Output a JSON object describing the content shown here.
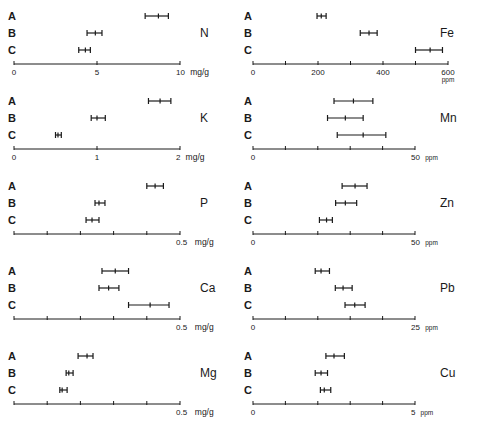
{
  "chart_data": [
    {
      "type": "errorbar",
      "element": "N",
      "unit": "mg/g",
      "xlim": [
        0,
        10
      ],
      "ticks": [
        0,
        5,
        10
      ],
      "tick_labels": [
        "0",
        "5",
        "10"
      ],
      "minor_ticks": [],
      "unit_label": "mg/g",
      "groups": [
        {
          "name": "A",
          "mean": 8.7,
          "low": 7.9,
          "high": 9.3
        },
        {
          "name": "B",
          "mean": 4.9,
          "low": 4.4,
          "high": 5.3
        },
        {
          "name": "C",
          "mean": 4.3,
          "low": 3.9,
          "high": 4.6
        }
      ]
    },
    {
      "type": "errorbar",
      "element": "K",
      "unit": "mg/g",
      "xlim": [
        0,
        2
      ],
      "ticks": [
        0,
        1,
        2
      ],
      "tick_labels": [
        "0",
        "1",
        "2"
      ],
      "unit_label": "mg/g",
      "groups": [
        {
          "name": "A",
          "mean": 1.76,
          "low": 1.62,
          "high": 1.89
        },
        {
          "name": "B",
          "mean": 1.0,
          "low": 0.93,
          "high": 1.1
        },
        {
          "name": "C",
          "mean": 0.53,
          "low": 0.5,
          "high": 0.57
        }
      ]
    },
    {
      "type": "errorbar",
      "element": "P",
      "unit": "mg/g",
      "xlim": [
        0,
        0.5
      ],
      "ticks": [
        0,
        0.1,
        0.2,
        0.3,
        0.4,
        0.5
      ],
      "tick_labels": [
        "",
        "",
        "",
        "",
        "",
        "0.5"
      ],
      "unit_label": "mg/g",
      "groups": [
        {
          "name": "A",
          "mean": 0.425,
          "low": 0.4,
          "high": 0.45
        },
        {
          "name": "B",
          "mean": 0.256,
          "low": 0.244,
          "high": 0.274
        },
        {
          "name": "C",
          "mean": 0.235,
          "low": 0.217,
          "high": 0.256
        }
      ]
    },
    {
      "type": "errorbar",
      "element": "Ca",
      "unit": "mg/g",
      "xlim": [
        0,
        0.5
      ],
      "ticks": [
        0,
        0.1,
        0.2,
        0.3,
        0.4,
        0.5
      ],
      "tick_labels": [
        "",
        "",
        "",
        "",
        "",
        "0.5"
      ],
      "unit_label": "mg/g",
      "groups": [
        {
          "name": "A",
          "mean": 0.305,
          "low": 0.265,
          "high": 0.345
        },
        {
          "name": "B",
          "mean": 0.285,
          "low": 0.256,
          "high": 0.316
        },
        {
          "name": "C",
          "mean": 0.41,
          "low": 0.345,
          "high": 0.467
        }
      ]
    },
    {
      "type": "errorbar",
      "element": "Mg",
      "unit": "mg/g",
      "xlim": [
        0,
        0.5
      ],
      "ticks": [
        0,
        0.1,
        0.2,
        0.3,
        0.4,
        0.5
      ],
      "tick_labels": [
        "",
        "",
        "",
        "",
        "",
        "0.5"
      ],
      "unit_label": "mg/g",
      "groups": [
        {
          "name": "A",
          "mean": 0.22,
          "low": 0.193,
          "high": 0.238
        },
        {
          "name": "B",
          "mean": 0.165,
          "low": 0.157,
          "high": 0.178
        },
        {
          "name": "C",
          "mean": 0.145,
          "low": 0.138,
          "high": 0.16
        }
      ]
    },
    {
      "type": "errorbar",
      "element": "Fe",
      "unit": "ppm",
      "xlim": [
        0,
        600
      ],
      "ticks": [
        0,
        100,
        200,
        300,
        400,
        500,
        600
      ],
      "tick_labels": [
        "0",
        "",
        "200",
        "",
        "400",
        "",
        "600"
      ],
      "unit_label": "ppm",
      "groups": [
        {
          "name": "A",
          "mean": 210,
          "low": 197,
          "high": 225
        },
        {
          "name": "B",
          "mean": 357,
          "low": 330,
          "high": 382
        },
        {
          "name": "C",
          "mean": 545,
          "low": 500,
          "high": 583
        }
      ]
    },
    {
      "type": "errorbar",
      "element": "Mn",
      "unit": "ppm",
      "xlim": [
        0,
        50
      ],
      "ticks": [
        0,
        10,
        20,
        30,
        40,
        50
      ],
      "tick_labels": [
        "0",
        "",
        "",
        "",
        "",
        "50"
      ],
      "unit_label": "ppm",
      "groups": [
        {
          "name": "A",
          "mean": 31,
          "low": 25,
          "high": 37
        },
        {
          "name": "B",
          "mean": 28.5,
          "low": 23,
          "high": 34
        },
        {
          "name": "C",
          "mean": 34,
          "low": 26,
          "high": 41
        }
      ]
    },
    {
      "type": "errorbar",
      "element": "Zn",
      "unit": "ppm",
      "xlim": [
        0,
        50
      ],
      "ticks": [
        0,
        10,
        20,
        30,
        40,
        50
      ],
      "tick_labels": [
        "0",
        "",
        "",
        "",
        "",
        "50"
      ],
      "unit_label": "ppm",
      "groups": [
        {
          "name": "A",
          "mean": 31.5,
          "low": 27.5,
          "high": 35.2
        },
        {
          "name": "B",
          "mean": 28.5,
          "low": 25.5,
          "high": 32
        },
        {
          "name": "C",
          "mean": 22.7,
          "low": 20.5,
          "high": 24.5
        }
      ]
    },
    {
      "type": "errorbar",
      "element": "Pb",
      "unit": "ppm",
      "xlim": [
        0,
        25
      ],
      "ticks": [
        0,
        5,
        10,
        15,
        20,
        25
      ],
      "tick_labels": [
        "0",
        "",
        "",
        "",
        "",
        "25"
      ],
      "unit_label": "ppm",
      "groups": [
        {
          "name": "A",
          "mean": 10.5,
          "low": 9.6,
          "high": 11.8
        },
        {
          "name": "B",
          "mean": 13.9,
          "low": 12.7,
          "high": 15.3
        },
        {
          "name": "C",
          "mean": 15.7,
          "low": 14.2,
          "high": 17.3
        }
      ]
    },
    {
      "type": "errorbar",
      "element": "Cu",
      "unit": "ppm",
      "xlim": [
        0,
        5
      ],
      "ticks": [
        0,
        1,
        2,
        3,
        4,
        5
      ],
      "tick_labels": [
        "0",
        "",
        "",
        "",
        "",
        "5"
      ],
      "unit_label": "ppm",
      "groups": [
        {
          "name": "A",
          "mean": 2.5,
          "low": 2.25,
          "high": 2.82
        },
        {
          "name": "B",
          "mean": 2.1,
          "low": 1.92,
          "high": 2.3
        },
        {
          "name": "C",
          "mean": 2.2,
          "low": 2.08,
          "high": 2.4
        }
      ]
    }
  ],
  "layout": {
    "left_column": [
      "N",
      "K",
      "P",
      "Ca",
      "Mg"
    ],
    "right_column": [
      "Fe",
      "Mn",
      "Zn",
      "Pb",
      "Cu"
    ]
  },
  "group_labels": [
    "A",
    "B",
    "C"
  ]
}
